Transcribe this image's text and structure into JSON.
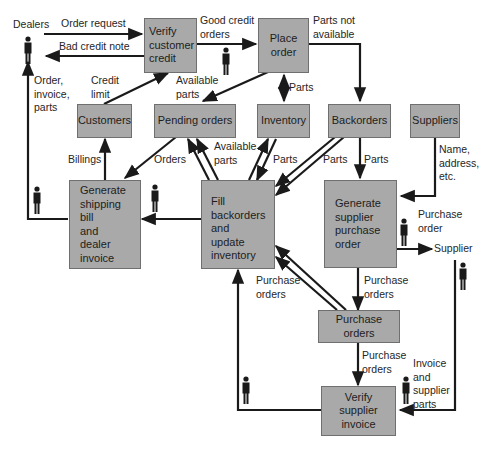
{
  "diagram": {
    "type": "data-flow-diagram",
    "colors": {
      "process_fill": "#a9a9a9",
      "line": "#1a1a1a",
      "background": "#ffffff"
    },
    "external_entities": [
      {
        "id": "dealers",
        "label": "Dealers"
      },
      {
        "id": "supplier",
        "label": "Supplier"
      }
    ],
    "processes": [
      {
        "id": "verify_credit",
        "label": "Verify\ncustomer\ncredit"
      },
      {
        "id": "place_order",
        "label": "Place\norder"
      },
      {
        "id": "gen_shipping",
        "label": "Generate\nshipping\nbill\nand\ndealer\ninvoice"
      },
      {
        "id": "fill_backorders",
        "label": "Fill\nbackorders\nand\nupdate\ninventory"
      },
      {
        "id": "gen_po",
        "label": "Generate\nsupplier\npurchase\norder"
      },
      {
        "id": "verify_invoice",
        "label": "Verify\nsupplier\ninvoice"
      }
    ],
    "data_stores": [
      {
        "id": "customers",
        "label": "Customers"
      },
      {
        "id": "pending",
        "label": "Pending orders"
      },
      {
        "id": "inventory",
        "label": "Inventory"
      },
      {
        "id": "backorders",
        "label": "Backorders"
      },
      {
        "id": "suppliers",
        "label": "Suppliers"
      },
      {
        "id": "purchase_orders",
        "label": "Purchase orders"
      }
    ],
    "flow_labels": {
      "order_request": "Order request",
      "bad_credit": "Bad credit note",
      "good_credit": "Good credit\norders",
      "parts_not_available": "Parts not\navailable",
      "credit_limit": "Credit\nlimit",
      "available_parts_top": "Available\nparts",
      "parts_place_inv": "Parts",
      "order_invoice_parts": "Order,\ninvoice,\nparts",
      "billings": "Billings",
      "orders": "Orders",
      "available_parts_mid": "Available\nparts",
      "parts_inv_fill": "Parts",
      "parts_back_fill": "Parts",
      "parts_back_po": "Parts",
      "name_address": "Name,\naddress,\netc.",
      "purchase_order": "Purchase\norder",
      "purchase_orders_fill": "Purchase\norders",
      "purchase_orders_gen": "Purchase\norders",
      "purchase_orders_verify": "Purchase\norders",
      "invoice_supplier_parts": "Invoice\nand\nsupplier\nparts"
    }
  }
}
